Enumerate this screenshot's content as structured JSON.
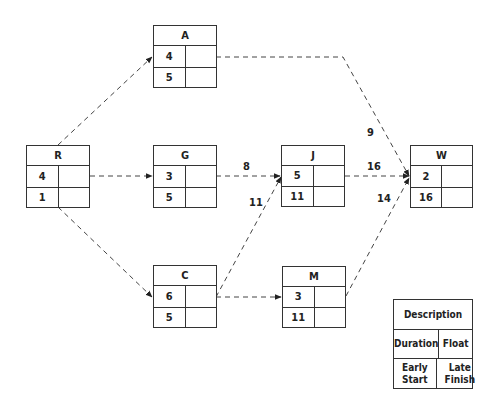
{
  "diagram": {
    "type": "activity-on-node network",
    "nodes": [
      {
        "id": "A",
        "label": "A",
        "duration": "4",
        "early_start": "5",
        "float": "",
        "late_finish": ""
      },
      {
        "id": "R",
        "label": "R",
        "duration": "4",
        "early_start": "1",
        "float": "",
        "late_finish": ""
      },
      {
        "id": "G",
        "label": "G",
        "duration": "3",
        "early_start": "5",
        "float": "",
        "late_finish": ""
      },
      {
        "id": "J",
        "label": "J",
        "duration": "5",
        "early_start": "11",
        "float": "",
        "late_finish": ""
      },
      {
        "id": "W",
        "label": "W",
        "duration": "2",
        "early_start": "16",
        "float": "",
        "late_finish": ""
      },
      {
        "id": "C",
        "label": "C",
        "duration": "6",
        "early_start": "5",
        "float": "",
        "late_finish": ""
      },
      {
        "id": "M",
        "label": "M",
        "duration": "3",
        "early_start": "11",
        "float": "",
        "late_finish": ""
      }
    ],
    "edges": [
      {
        "from": "R",
        "to": "A",
        "label": ""
      },
      {
        "from": "R",
        "to": "G",
        "label": ""
      },
      {
        "from": "R",
        "to": "C",
        "label": ""
      },
      {
        "from": "G",
        "to": "J",
        "label": "8"
      },
      {
        "from": "C",
        "to": "J",
        "label": "11"
      },
      {
        "from": "C",
        "to": "M",
        "label": ""
      },
      {
        "from": "A",
        "to": "W",
        "label": "9"
      },
      {
        "from": "J",
        "to": "W",
        "label": "16"
      },
      {
        "from": "M",
        "to": "W",
        "label": "14"
      }
    ],
    "legend": {
      "title": "Description",
      "duration": "Duration",
      "float": "Float",
      "early_start": "Early Start",
      "late_finish": "Late Finish"
    }
  }
}
